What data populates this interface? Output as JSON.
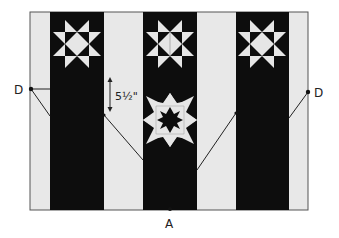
{
  "diagram": {
    "colors": {
      "background": "#ffffff",
      "light_strip": "#e8e8e8",
      "dark_strip": "#0d0d0d",
      "star_light": "#e6e6e6",
      "line": "#222222"
    },
    "frame": {
      "x": 30,
      "y": 12,
      "width": 278,
      "height": 198
    },
    "dark_strips": [
      {
        "name": "left",
        "x": 50,
        "width": 54
      },
      {
        "name": "middle",
        "x": 143,
        "width": 54
      },
      {
        "name": "right",
        "x": 236,
        "width": 53
      }
    ],
    "stars": [
      {
        "name": "star-top-left",
        "type": "sawtooth-star",
        "cx": 77,
        "cy": 44,
        "size": 50
      },
      {
        "name": "star-top-middle",
        "type": "sawtooth-star",
        "cx": 170,
        "cy": 44,
        "size": 50
      },
      {
        "name": "star-top-right",
        "type": "sawtooth-star",
        "cx": 262,
        "cy": 44,
        "size": 50
      },
      {
        "name": "star-lower-middle",
        "type": "eight-point-star-with-inner-star",
        "cx": 170,
        "cy": 120,
        "size": 54
      }
    ],
    "points": [
      {
        "label": "D",
        "x": 31,
        "y": 89,
        "side": "left"
      },
      {
        "label": "D",
        "x": 308,
        "y": 92,
        "side": "right"
      },
      {
        "label": "A",
        "x": 170,
        "y": 209,
        "side": "bottom"
      }
    ],
    "labels": {
      "left_point": "D",
      "right_point": "D",
      "bottom_point": "A",
      "measurement": "5½\""
    },
    "measurement": {
      "value": "5½\"",
      "x": 110,
      "y1": 78,
      "y2": 110
    }
  }
}
